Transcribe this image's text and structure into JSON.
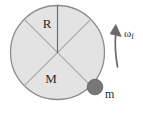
{
  "figure": {
    "type": "physics-diagram",
    "canvas": {
      "width": 143,
      "height": 113,
      "background": "#ffffff"
    },
    "disk": {
      "name": "rotating-disk",
      "center_x": 57.5,
      "center_y": 52.5,
      "radius": 47.5,
      "fill_color": "#e3e3e3",
      "stroke_color": "#8d8d8d",
      "stroke_width": 1.3
    },
    "spokes": {
      "stroke_color": "#a5a5a5",
      "stroke_width": 1.2,
      "diagonal_angles_deg": [
        45,
        135,
        225,
        315
      ],
      "vertical_radius_angle_deg": 90
    },
    "vertical_radius": {
      "name": "radius-line",
      "stroke_color": "#6f6f6f",
      "stroke_width": 1.2
    },
    "labels": {
      "radius": {
        "text": "R",
        "x": 47,
        "y": 25,
        "meaning": "disk radius"
      },
      "mass_of_disk": {
        "text": "M",
        "x": 51,
        "y": 80,
        "meaning": "mass of disk"
      },
      "point_mass": {
        "text": "m",
        "x": 105,
        "y": 95,
        "meaning": "point mass attached to rim"
      },
      "angular_velocity": {
        "text": "ω",
        "subscript": "f",
        "x": 124,
        "y": 33,
        "meaning": "final angular velocity"
      }
    },
    "point_mass_marker": {
      "name": "point-mass-marker",
      "center_x": 95,
      "center_y": 87,
      "radius": 8,
      "fill_color": "#787878",
      "stroke_color": "#5a5a5a"
    },
    "rotation_arrow": {
      "name": "rotation-direction-arrow",
      "stroke_color": "#6a6a6a",
      "fill_color": "#6a6a6a",
      "stroke_width": 1.6,
      "direction": "counterclockwise-upward",
      "path": "M 116.5 66 C 116 52 115.5 44 116 34"
    }
  }
}
